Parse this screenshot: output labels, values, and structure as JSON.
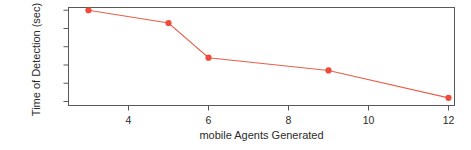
{
  "chart_data": {
    "type": "line",
    "title": "",
    "xlabel": "mobile Agents Generated",
    "ylabel": "Time of Detection (sec)",
    "x": [
      3,
      5,
      6,
      9,
      12
    ],
    "values": [
      90,
      83,
      64,
      57,
      42
    ],
    "series": [
      {
        "name": "Time of Detection",
        "x": [
          3,
          5,
          6,
          9,
          12
        ],
        "values": [
          90,
          83,
          64,
          57,
          42
        ]
      }
    ],
    "xlim": [
      2.5,
      12.15
    ],
    "ylim": [
      37.8,
      91.5
    ],
    "xticks": [
      4,
      6,
      8,
      10,
      12
    ],
    "xtick_labels": [
      "4",
      "6",
      "8",
      "10",
      "12"
    ],
    "yticks": [
      40,
      50,
      60,
      70,
      80,
      90
    ],
    "ytick_labels": [
      "40",
      "50",
      "60",
      "70",
      "80",
      "90"
    ],
    "grid": false,
    "legend": null,
    "marker": "filled-circle",
    "line_color": "#e8604c",
    "marker_color": "#f04a38",
    "axis_color": "#595959",
    "background": "#ffffff"
  },
  "axes": {
    "y_title": "Time of Detection (sec)",
    "x_title": "mobile Agents Generated"
  }
}
